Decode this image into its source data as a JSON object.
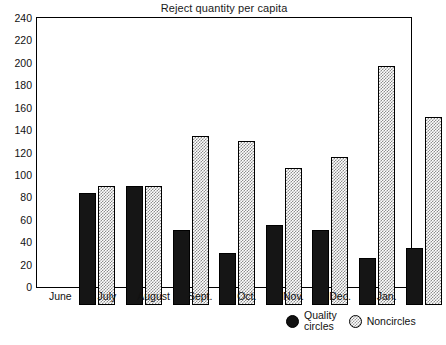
{
  "chart_data": {
    "type": "bar",
    "title": "Reject quantity per capita",
    "xlabel": "",
    "ylabel": "",
    "ylim": [
      0,
      240
    ],
    "ytick_step": 20,
    "yticks": [
      0,
      20,
      40,
      60,
      80,
      100,
      120,
      140,
      160,
      180,
      200,
      220,
      240
    ],
    "grid": false,
    "legend_position": "bottom-right",
    "categories": [
      "June",
      "July",
      "August",
      "Sept.",
      "Oct.",
      "Nov.",
      "Dec.",
      "Jan."
    ],
    "series": [
      {
        "name": "Quality\ncircles",
        "marker": "filled-circle",
        "color": "#151515",
        "values": [
          100,
          106,
          67,
          46,
          71,
          67,
          42,
          51
        ]
      },
      {
        "name": "Noncircles",
        "marker": "stippled-circle",
        "color": "#cfcfcf",
        "values": [
          106,
          106,
          151,
          146,
          122,
          132,
          213,
          168
        ]
      }
    ]
  },
  "legend": {
    "entries": [
      {
        "label": "Quality\ncircles",
        "swatch": "filled-circle-icon"
      },
      {
        "label": "Noncircles",
        "swatch": "stippled-circle-icon"
      }
    ]
  },
  "colors": {
    "axis": "#000000",
    "series_quality_circles": "#151515",
    "series_noncircles": "#cfcfcf",
    "background": "#ffffff"
  }
}
